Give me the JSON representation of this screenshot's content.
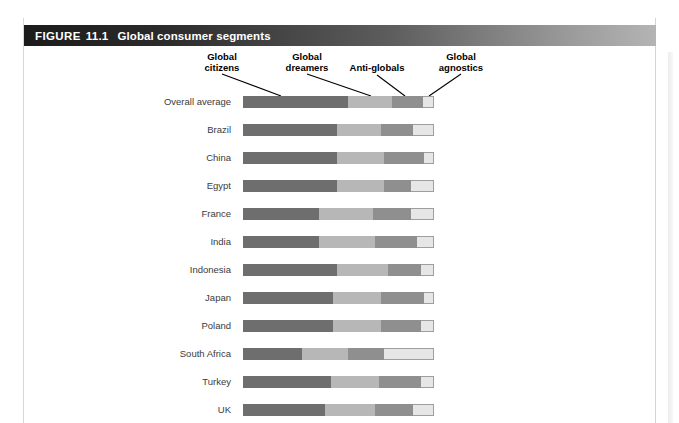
{
  "header": {
    "figure_word": "FIGURE",
    "figure_number": "11.1",
    "title": "Global consumer segments"
  },
  "legend": [
    {
      "id": "global-citizens",
      "line1": "Global",
      "line2": "citizens",
      "color": "#6e6e6e"
    },
    {
      "id": "global-dreamers",
      "line1": "Global",
      "line2": "dreamers",
      "color": "#b7b7b7"
    },
    {
      "id": "anti-globals",
      "line1": "Anti-globals",
      "line2": "",
      "color": "#8f8f8f"
    },
    {
      "id": "global-agnostics",
      "line1": "Global",
      "line2": "agnostics",
      "color": "#e6e6e6"
    }
  ],
  "chart_data": {
    "type": "bar",
    "subtype": "stacked-horizontal-100pct",
    "title": "Global consumer segments",
    "xlabel": "",
    "ylabel": "",
    "xlim": [
      0,
      100
    ],
    "grid": false,
    "legend_position": "top-callouts",
    "categories": [
      "Overall average",
      "Brazil",
      "China",
      "Egypt",
      "France",
      "India",
      "Indonesia",
      "Japan",
      "Poland",
      "South Africa",
      "Turkey",
      "UK"
    ],
    "series": [
      {
        "name": "Global citizens",
        "color": "#6e6e6e",
        "values": [
          55,
          49,
          49,
          49,
          40,
          40,
          49,
          47,
          47,
          31,
          46,
          43
        ]
      },
      {
        "name": "Global dreamers",
        "color": "#b7b7b7",
        "values": [
          23,
          23,
          25,
          25,
          28,
          29,
          27,
          25,
          25,
          24,
          25,
          26
        ]
      },
      {
        "name": "Anti-globals",
        "color": "#8f8f8f",
        "values": [
          16,
          17,
          21,
          14,
          20,
          22,
          17,
          23,
          21,
          19,
          22,
          20
        ]
      },
      {
        "name": "Global agnostics",
        "color": "#e6e6e6",
        "values": [
          6,
          11,
          5,
          12,
          12,
          9,
          7,
          5,
          7,
          26,
          7,
          11
        ]
      }
    ]
  }
}
